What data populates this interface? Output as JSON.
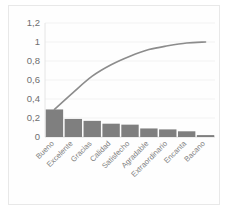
{
  "chart_data": {
    "type": "bar",
    "title": "",
    "subtitle": "",
    "xlabel": "",
    "ylabel": "",
    "categories": [
      "Bueno",
      "Excelente",
      "Gracias",
      "Calidad",
      "Satisfecho",
      "Agradable",
      "Extraordinario",
      "Encanta",
      "Bacano"
    ],
    "series": [
      {
        "name": "Frecuencia relativa",
        "kind": "bar",
        "values": [
          0.29,
          0.19,
          0.17,
          0.14,
          0.13,
          0.09,
          0.08,
          0.06,
          0.02
        ]
      },
      {
        "name": "Porcentaje acumulado",
        "kind": "line",
        "values": [
          0.29,
          0.47,
          0.64,
          0.76,
          0.85,
          0.92,
          0.96,
          0.99,
          1.0
        ]
      }
    ],
    "ylim": [
      0,
      1.2
    ],
    "ytick_values": [
      0,
      0.2,
      0.4,
      0.6,
      0.8,
      1.0,
      1.2
    ],
    "ytick_labels": [
      "0",
      "0,2",
      "0,4",
      "0,6",
      "0,8",
      "1",
      "1,2"
    ],
    "grid": true,
    "legend": "none",
    "colors": {
      "bar": "#7f7f7f",
      "line": "#8c8c8c",
      "grid": "#f0f0f0",
      "axis": "#e0e0e0",
      "tick_text": "#6e6e6e",
      "category_text": "#808080",
      "plot_background": "#fefefe",
      "frame_border": "#e8e8e8"
    }
  }
}
